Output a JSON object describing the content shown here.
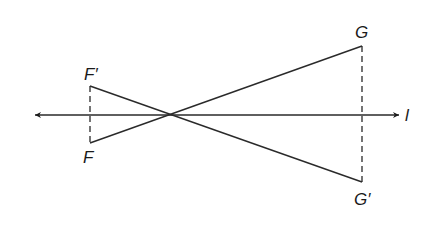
{
  "diagram": {
    "type": "reflection across line",
    "line": {
      "label": "l",
      "y": 115,
      "x_start": 35,
      "x_end": 399,
      "arrows": "both"
    },
    "intersection_point": {
      "x": 173,
      "y": 115
    },
    "points": {
      "F_prime": {
        "label": "F′",
        "x": 90,
        "y": 86
      },
      "F": {
        "label": "F",
        "x": 90,
        "y": 143
      },
      "G": {
        "label": "G",
        "x": 362,
        "y": 46
      },
      "G_prime": {
        "label": "G′",
        "x": 362,
        "y": 182
      }
    },
    "segments": [
      {
        "from": "F_prime",
        "to": "G_prime",
        "style": "solid"
      },
      {
        "from": "F",
        "to": "G",
        "style": "solid"
      },
      {
        "from": "F_prime",
        "to": "F",
        "style": "dashed"
      },
      {
        "from": "G",
        "to": "G_prime",
        "style": "dashed"
      }
    ],
    "colors": {
      "stroke": "#2a2a2a",
      "background": "#ffffff"
    }
  }
}
